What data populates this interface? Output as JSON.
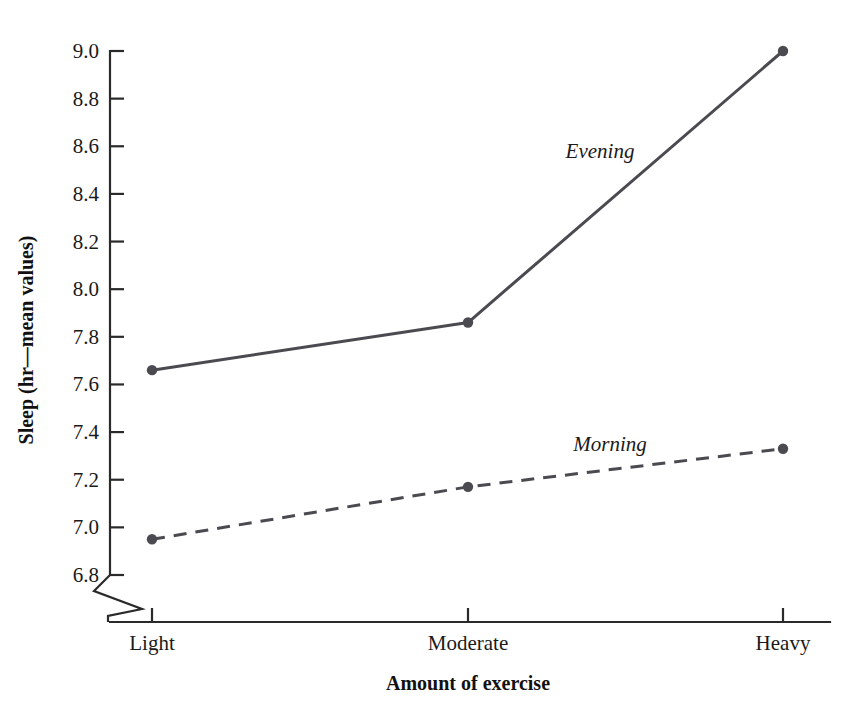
{
  "chart_data": {
    "type": "line",
    "title": "",
    "xlabel": "Amount of exercise",
    "ylabel": "Sleep (hr—mean values)",
    "categories": [
      "Light",
      "Moderate",
      "Heavy"
    ],
    "ylim": [
      6.8,
      9.0
    ],
    "ytick_step": 0.2,
    "ytick_labels": [
      "6.8",
      "7.0",
      "7.2",
      "7.4",
      "7.6",
      "7.8",
      "8.0",
      "8.2",
      "8.4",
      "8.6",
      "8.8",
      "9.0"
    ],
    "grid": false,
    "legend_position": "inline-annotations",
    "y_axis_break": true,
    "series": [
      {
        "name": "Evening",
        "values": [
          7.66,
          7.86,
          9.0
        ],
        "style": "solid",
        "color": "#4a4a50",
        "marker": "circle",
        "label_x": 600,
        "label_y": 158
      },
      {
        "name": "Morning",
        "values": [
          6.95,
          7.17,
          7.33
        ],
        "style": "dashed",
        "color": "#4a4a50",
        "marker": "circle",
        "label_x": 610,
        "label_y": 451
      }
    ]
  },
  "axes": {
    "y_tick_values": [
      6.8,
      7.0,
      7.2,
      7.4,
      7.6,
      7.8,
      8.0,
      8.2,
      8.4,
      8.6,
      8.8,
      9.0
    ],
    "x_tick_positions": [
      152,
      468,
      783
    ],
    "y_label_text": "Sleep (hr—mean values)",
    "x_label_text": "Amount of exercise"
  },
  "colors": {
    "axis": "#2a2a2a",
    "text": "#1a1a1a",
    "series": "#4a4a50",
    "background": "#ffffff"
  }
}
